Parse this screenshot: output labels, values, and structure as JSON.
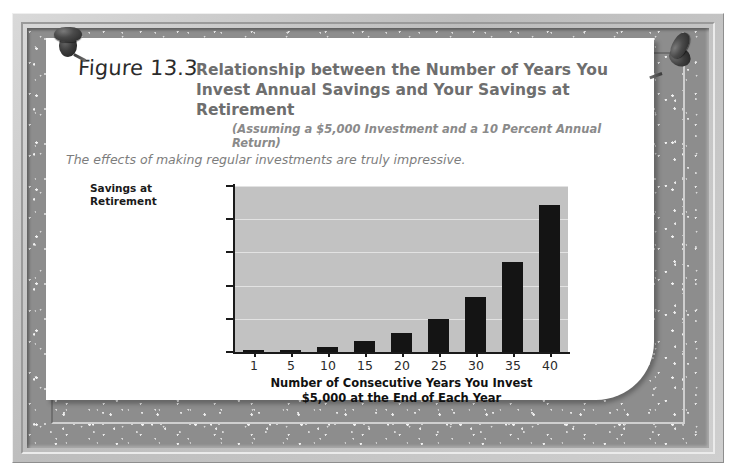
{
  "figure": {
    "label": "Figure 13.3",
    "title_line1": "Relationship between the Number of Years You",
    "title_line2": "Invest Annual Savings and Your Savings at Retirement",
    "subtitle": "(Assuming a $5,000 Investment and a 10 Percent Annual Return)",
    "lede": "The effects of making regular investments are truly impressive.",
    "pin_left": "pushpin-icon",
    "pin_right": "pushpin-icon"
  },
  "colors": {
    "plot_background": "#c2c2c2",
    "bar": "#141414",
    "gridline": "#e2e2e2",
    "title_text": "#6e6e6e",
    "axis_text": "#2a2a2a",
    "paper": "#ffffff",
    "mat": "#8d8d8d"
  },
  "chart_data": {
    "type": "bar",
    "title": "Relationship between the Number of Years You Invest Annual Savings and Your Savings at Retirement",
    "subtitle": "(Assuming a $5,000 Investment and a 10 Percent Annual Return)",
    "xlabel": "Number of Consecutive Years You Invest $5,000 at the End of Each Year",
    "xlabel_line1": "Number of Consecutive Years You Invest",
    "xlabel_line2": "$5,000 at the End of Each Year",
    "ylabel": "Savings at Retirement",
    "ylabel_line1": "Savings at",
    "ylabel_line2": "Retirement",
    "categories": [
      "1",
      "5",
      "10",
      "15",
      "20",
      "25",
      "30",
      "35",
      "40"
    ],
    "values": [
      5000,
      30526,
      79687,
      158862,
      286375,
      491735,
      822470,
      1355122,
      2212963
    ],
    "ylim": [
      0,
      2500000
    ],
    "yticks": [
      0,
      500000,
      1000000,
      1500000,
      2000000,
      2500000
    ],
    "ytick_labels": [
      "$0",
      "$500,000",
      "$1,000,000",
      "$1,500,000",
      "$2,000,000",
      "$2,500,000"
    ],
    "grid": true,
    "legend": "none"
  }
}
